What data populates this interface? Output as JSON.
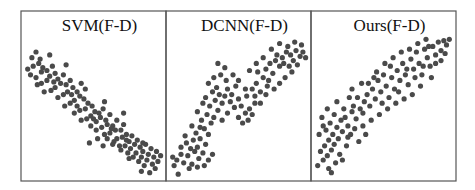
{
  "chart_data": [
    {
      "type": "scatter",
      "title": "SVM(F-D)",
      "xlabel": "",
      "ylabel": "",
      "xlim": [
        0,
        1
      ],
      "ylim": [
        0,
        1
      ],
      "grid": false,
      "legend": "none",
      "trend": "negative",
      "points": [
        [
          0.05,
          0.84
        ],
        [
          0.08,
          0.88
        ],
        [
          0.06,
          0.78
        ],
        [
          0.1,
          0.8
        ],
        [
          0.13,
          0.77
        ],
        [
          0.02,
          0.76
        ],
        [
          0.04,
          0.72
        ],
        [
          0.08,
          0.7
        ],
        [
          0.12,
          0.74
        ],
        [
          0.16,
          0.75
        ],
        [
          0.18,
          0.71
        ],
        [
          0.2,
          0.78
        ],
        [
          0.22,
          0.73
        ],
        [
          0.16,
          0.68
        ],
        [
          0.12,
          0.66
        ],
        [
          0.09,
          0.65
        ],
        [
          0.24,
          0.69
        ],
        [
          0.28,
          0.72
        ],
        [
          0.26,
          0.66
        ],
        [
          0.22,
          0.63
        ],
        [
          0.19,
          0.61
        ],
        [
          0.14,
          0.6
        ],
        [
          0.3,
          0.65
        ],
        [
          0.33,
          0.68
        ],
        [
          0.35,
          0.63
        ],
        [
          0.31,
          0.6
        ],
        [
          0.28,
          0.58
        ],
        [
          0.24,
          0.56
        ],
        [
          0.38,
          0.6
        ],
        [
          0.41,
          0.66
        ],
        [
          0.4,
          0.57
        ],
        [
          0.36,
          0.54
        ],
        [
          0.33,
          0.52
        ],
        [
          0.29,
          0.5
        ],
        [
          0.43,
          0.55
        ],
        [
          0.46,
          0.52
        ],
        [
          0.44,
          0.48
        ],
        [
          0.4,
          0.47
        ],
        [
          0.36,
          0.45
        ],
        [
          0.49,
          0.5
        ],
        [
          0.51,
          0.46
        ],
        [
          0.48,
          0.43
        ],
        [
          0.45,
          0.41
        ],
        [
          0.41,
          0.4
        ],
        [
          0.54,
          0.45
        ],
        [
          0.57,
          0.48
        ],
        [
          0.55,
          0.42
        ],
        [
          0.52,
          0.39
        ],
        [
          0.48,
          0.36
        ],
        [
          0.59,
          0.4
        ],
        [
          0.62,
          0.44
        ],
        [
          0.6,
          0.37
        ],
        [
          0.56,
          0.35
        ],
        [
          0.52,
          0.33
        ],
        [
          0.64,
          0.36
        ],
        [
          0.67,
          0.4
        ],
        [
          0.66,
          0.33
        ],
        [
          0.62,
          0.31
        ],
        [
          0.58,
          0.3
        ],
        [
          0.7,
          0.33
        ],
        [
          0.72,
          0.37
        ],
        [
          0.71,
          0.28
        ],
        [
          0.67,
          0.27
        ],
        [
          0.74,
          0.3
        ],
        [
          0.76,
          0.25
        ],
        [
          0.73,
          0.22
        ],
        [
          0.78,
          0.29
        ],
        [
          0.8,
          0.23
        ],
        [
          0.77,
          0.2
        ],
        [
          0.82,
          0.26
        ],
        [
          0.84,
          0.21
        ],
        [
          0.81,
          0.17
        ],
        [
          0.86,
          0.18
        ],
        [
          0.88,
          0.23
        ],
        [
          0.85,
          0.14
        ],
        [
          0.9,
          0.16
        ],
        [
          0.92,
          0.2
        ],
        [
          0.89,
          0.12
        ],
        [
          0.94,
          0.14
        ],
        [
          0.96,
          0.18
        ],
        [
          0.93,
          0.09
        ],
        [
          0.97,
          0.11
        ],
        [
          0.87,
          0.08
        ],
        [
          0.83,
          0.11
        ],
        [
          0.79,
          0.14
        ],
        [
          0.75,
          0.17
        ],
        [
          0.69,
          0.22
        ],
        [
          0.65,
          0.25
        ],
        [
          0.95,
          0.06
        ],
        [
          0.91,
          0.03
        ],
        [
          0.99,
          0.15
        ],
        [
          0.85,
          0.04
        ],
        [
          0.18,
          0.86
        ],
        [
          0.3,
          0.79
        ],
        [
          0.44,
          0.62
        ],
        [
          0.58,
          0.53
        ],
        [
          0.72,
          0.45
        ],
        [
          0.64,
          0.23
        ],
        [
          0.7,
          0.19
        ],
        [
          0.76,
          0.13
        ],
        [
          0.53,
          0.27
        ],
        [
          0.47,
          0.24
        ],
        [
          0.6,
          0.27
        ],
        [
          0.57,
          0.22
        ],
        [
          0.11,
          0.83
        ],
        [
          0.21,
          0.67
        ],
        [
          0.34,
          0.58
        ],
        [
          0.38,
          0.5
        ],
        [
          0.5,
          0.41
        ],
        [
          0.63,
          0.34
        ],
        [
          0.74,
          0.26
        ],
        [
          0.86,
          0.24
        ]
      ]
    },
    {
      "type": "scatter",
      "title": "DCNN(F-D)",
      "xlabel": "",
      "ylabel": "",
      "xlim": [
        0,
        1
      ],
      "ylim": [
        0,
        1
      ],
      "grid": false,
      "legend": "none",
      "trend": "positive",
      "points": [
        [
          0.02,
          0.14
        ],
        [
          0.05,
          0.12
        ],
        [
          0.08,
          0.16
        ],
        [
          0.03,
          0.08
        ],
        [
          0.1,
          0.1
        ],
        [
          0.13,
          0.15
        ],
        [
          0.15,
          0.2
        ],
        [
          0.12,
          0.24
        ],
        [
          0.17,
          0.26
        ],
        [
          0.2,
          0.21
        ],
        [
          0.22,
          0.27
        ],
        [
          0.18,
          0.18
        ],
        [
          0.24,
          0.17
        ],
        [
          0.21,
          0.13
        ],
        [
          0.26,
          0.23
        ],
        [
          0.28,
          0.3
        ],
        [
          0.25,
          0.34
        ],
        [
          0.3,
          0.38
        ],
        [
          0.23,
          0.4
        ],
        [
          0.27,
          0.44
        ],
        [
          0.32,
          0.42
        ],
        [
          0.35,
          0.47
        ],
        [
          0.29,
          0.5
        ],
        [
          0.33,
          0.54
        ],
        [
          0.26,
          0.56
        ],
        [
          0.31,
          0.6
        ],
        [
          0.36,
          0.58
        ],
        [
          0.38,
          0.52
        ],
        [
          0.4,
          0.57
        ],
        [
          0.34,
          0.63
        ],
        [
          0.24,
          0.52
        ],
        [
          0.2,
          0.46
        ],
        [
          0.22,
          0.35
        ],
        [
          0.19,
          0.31
        ],
        [
          0.28,
          0.12
        ],
        [
          0.31,
          0.16
        ],
        [
          0.25,
          0.08
        ],
        [
          0.16,
          0.09
        ],
        [
          0.2,
          0.07
        ],
        [
          0.06,
          0.02
        ],
        [
          0.42,
          0.62
        ],
        [
          0.45,
          0.58
        ],
        [
          0.48,
          0.64
        ],
        [
          0.44,
          0.53
        ],
        [
          0.5,
          0.55
        ],
        [
          0.47,
          0.49
        ],
        [
          0.52,
          0.5
        ],
        [
          0.55,
          0.45
        ],
        [
          0.5,
          0.42
        ],
        [
          0.53,
          0.38
        ],
        [
          0.57,
          0.4
        ],
        [
          0.6,
          0.44
        ],
        [
          0.58,
          0.48
        ],
        [
          0.62,
          0.52
        ],
        [
          0.56,
          0.57
        ],
        [
          0.6,
          0.62
        ],
        [
          0.63,
          0.66
        ],
        [
          0.66,
          0.6
        ],
        [
          0.68,
          0.7
        ],
        [
          0.64,
          0.74
        ],
        [
          0.7,
          0.76
        ],
        [
          0.72,
          0.68
        ],
        [
          0.75,
          0.73
        ],
        [
          0.73,
          0.8
        ],
        [
          0.77,
          0.82
        ],
        [
          0.8,
          0.78
        ],
        [
          0.78,
          0.86
        ],
        [
          0.82,
          0.84
        ],
        [
          0.85,
          0.88
        ],
        [
          0.83,
          0.8
        ],
        [
          0.88,
          0.86
        ],
        [
          0.86,
          0.92
        ],
        [
          0.9,
          0.82
        ],
        [
          0.92,
          0.89
        ],
        [
          0.95,
          0.85
        ],
        [
          0.97,
          0.88
        ],
        [
          0.93,
          0.79
        ],
        [
          0.89,
          0.74
        ],
        [
          0.84,
          0.7
        ],
        [
          0.8,
          0.66
        ],
        [
          0.76,
          0.62
        ],
        [
          0.7,
          0.58
        ],
        [
          0.66,
          0.52
        ],
        [
          0.62,
          0.57
        ],
        [
          0.55,
          0.62
        ],
        [
          0.5,
          0.68
        ],
        [
          0.46,
          0.72
        ],
        [
          0.41,
          0.68
        ],
        [
          0.37,
          0.72
        ],
        [
          0.32,
          0.7
        ],
        [
          0.28,
          0.66
        ],
        [
          0.35,
          0.8
        ],
        [
          0.4,
          0.77
        ],
        [
          0.74,
          0.9
        ],
        [
          0.8,
          0.94
        ],
        [
          0.68,
          0.84
        ],
        [
          0.63,
          0.8
        ],
        [
          0.58,
          0.75
        ],
        [
          0.14,
          0.06
        ],
        [
          0.08,
          0.21
        ],
        [
          0.11,
          0.29
        ],
        [
          0.16,
          0.36
        ],
        [
          0.38,
          0.4
        ],
        [
          0.42,
          0.45
        ],
        [
          0.99,
          0.84
        ],
        [
          0.96,
          0.93
        ],
        [
          0.91,
          0.95
        ],
        [
          0.87,
          0.78
        ],
        [
          0.71,
          0.64
        ]
      ]
    },
    {
      "type": "scatter",
      "title": "Ours(F-D)",
      "xlabel": "",
      "ylabel": "",
      "xlim": [
        0,
        1
      ],
      "ylim": [
        0,
        1
      ],
      "grid": false,
      "legend": "none",
      "trend": "positive",
      "points": [
        [
          0.02,
          0.08
        ],
        [
          0.06,
          0.12
        ],
        [
          0.04,
          0.18
        ],
        [
          0.09,
          0.15
        ],
        [
          0.07,
          0.22
        ],
        [
          0.12,
          0.19
        ],
        [
          0.1,
          0.26
        ],
        [
          0.14,
          0.23
        ],
        [
          0.03,
          0.3
        ],
        [
          0.08,
          0.33
        ],
        [
          0.13,
          0.3
        ],
        [
          0.17,
          0.27
        ],
        [
          0.16,
          0.35
        ],
        [
          0.11,
          0.38
        ],
        [
          0.2,
          0.32
        ],
        [
          0.19,
          0.4
        ],
        [
          0.05,
          0.42
        ],
        [
          0.14,
          0.44
        ],
        [
          0.22,
          0.42
        ],
        [
          0.24,
          0.36
        ],
        [
          0.26,
          0.3
        ],
        [
          0.23,
          0.22
        ],
        [
          0.18,
          0.16
        ],
        [
          0.15,
          0.1
        ],
        [
          0.1,
          0.06
        ],
        [
          0.27,
          0.46
        ],
        [
          0.3,
          0.41
        ],
        [
          0.28,
          0.5
        ],
        [
          0.33,
          0.48
        ],
        [
          0.31,
          0.56
        ],
        [
          0.36,
          0.53
        ],
        [
          0.35,
          0.45
        ],
        [
          0.38,
          0.58
        ],
        [
          0.4,
          0.5
        ],
        [
          0.42,
          0.62
        ],
        [
          0.44,
          0.55
        ],
        [
          0.39,
          0.66
        ],
        [
          0.46,
          0.68
        ],
        [
          0.48,
          0.6
        ],
        [
          0.5,
          0.72
        ],
        [
          0.52,
          0.64
        ],
        [
          0.54,
          0.56
        ],
        [
          0.56,
          0.7
        ],
        [
          0.58,
          0.62
        ],
        [
          0.55,
          0.78
        ],
        [
          0.6,
          0.75
        ],
        [
          0.62,
          0.68
        ],
        [
          0.64,
          0.8
        ],
        [
          0.66,
          0.72
        ],
        [
          0.68,
          0.65
        ],
        [
          0.7,
          0.83
        ],
        [
          0.72,
          0.76
        ],
        [
          0.74,
          0.88
        ],
        [
          0.76,
          0.8
        ],
        [
          0.78,
          0.72
        ],
        [
          0.8,
          0.9
        ],
        [
          0.82,
          0.84
        ],
        [
          0.84,
          0.78
        ],
        [
          0.86,
          0.92
        ],
        [
          0.88,
          0.86
        ],
        [
          0.9,
          0.95
        ],
        [
          0.92,
          0.89
        ],
        [
          0.94,
          0.96
        ],
        [
          0.96,
          0.93
        ],
        [
          0.98,
          0.97
        ],
        [
          0.85,
          0.7
        ],
        [
          0.77,
          0.64
        ],
        [
          0.71,
          0.58
        ],
        [
          0.65,
          0.55
        ],
        [
          0.59,
          0.52
        ],
        [
          0.53,
          0.48
        ],
        [
          0.47,
          0.44
        ],
        [
          0.41,
          0.4
        ],
        [
          0.35,
          0.36
        ],
        [
          0.29,
          0.34
        ],
        [
          0.25,
          0.56
        ],
        [
          0.21,
          0.48
        ],
        [
          0.45,
          0.74
        ],
        [
          0.51,
          0.8
        ],
        [
          0.57,
          0.84
        ],
        [
          0.63,
          0.88
        ],
        [
          0.69,
          0.9
        ],
        [
          0.75,
          0.94
        ],
        [
          0.81,
          0.97
        ],
        [
          0.88,
          0.8
        ],
        [
          0.92,
          0.82
        ],
        [
          0.34,
          0.66
        ],
        [
          0.27,
          0.62
        ],
        [
          0.16,
          0.53
        ],
        [
          0.09,
          0.48
        ],
        [
          0.43,
          0.7
        ],
        [
          0.49,
          0.52
        ],
        [
          0.61,
          0.6
        ],
        [
          0.73,
          0.7
        ],
        [
          0.79,
          0.78
        ],
        [
          0.67,
          0.76
        ],
        [
          0.37,
          0.3
        ],
        [
          0.32,
          0.25
        ],
        [
          0.12,
          0.03
        ],
        [
          0.2,
          0.12
        ],
        [
          0.06,
          0.36
        ],
        [
          0.24,
          0.28
        ],
        [
          0.83,
          0.92
        ],
        [
          0.95,
          0.87
        ]
      ]
    }
  ]
}
